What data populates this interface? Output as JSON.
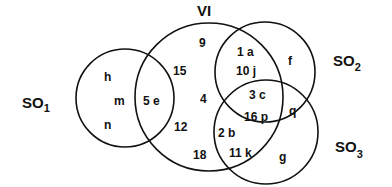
{
  "diagram": {
    "type": "venn",
    "sets": {
      "VI": {
        "label": "VI",
        "subscript": ""
      },
      "SO1": {
        "label": "SO",
        "subscript": "1"
      },
      "SO2": {
        "label": "SO",
        "subscript": "2"
      },
      "SO3": {
        "label": "SO",
        "subscript": "3"
      }
    },
    "regions": {
      "so1_only": [
        "h",
        "m",
        "n"
      ],
      "so1_vi": "5 e",
      "vi_only": [
        "9",
        "15",
        "4",
        "12",
        "18"
      ],
      "vi_so2": [
        "1 a",
        "10 j"
      ],
      "vi_so2_so3": [
        "3 c",
        "16 p"
      ],
      "vi_so3": [
        "2 b",
        "11 k"
      ],
      "so2_only": "f",
      "so2_so3": "q",
      "so3_only": "g"
    },
    "colors": {
      "stroke": "#111111",
      "text": "#111111",
      "background": "#ffffff"
    }
  }
}
